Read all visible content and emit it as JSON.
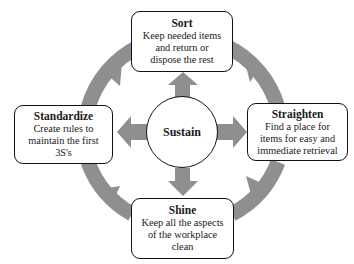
{
  "diagram": {
    "type": "5S cycle",
    "colors": {
      "arrow": "#8f8f8f",
      "border": "#111111",
      "background": "#ffffff"
    },
    "center": {
      "label": "Sustain"
    },
    "steps": [
      {
        "id": "sort",
        "title": "Sort",
        "lines": [
          "Keep needed items",
          "and return or",
          "dispose the rest"
        ],
        "position": "top"
      },
      {
        "id": "straighten",
        "title": "Straighten",
        "lines": [
          "Find a place for",
          "items for easy and",
          "immediate retrieval"
        ],
        "position": "right"
      },
      {
        "id": "shine",
        "title": "Shine",
        "lines": [
          "Keep all the aspects",
          "of the workplace",
          "clean"
        ],
        "position": "bottom"
      },
      {
        "id": "standardize",
        "title": "Standardize",
        "lines": [
          "Create rules to",
          "maintain the first",
          "3S's"
        ],
        "position": "left"
      }
    ],
    "cycle_direction": "clockwise"
  }
}
